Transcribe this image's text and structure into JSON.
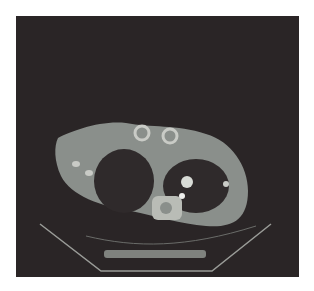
{
  "image": {
    "description": "Axial chest CT scan slice on dark background",
    "background_color": "#2a2526",
    "tissue_color": "#8f9490",
    "bone_color": "#c9cbc6"
  }
}
